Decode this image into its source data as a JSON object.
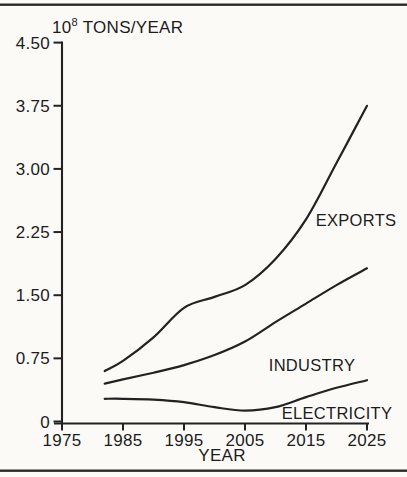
{
  "page": {
    "background": "#fbfaf7",
    "rule_color": "#2b2b29",
    "ink_color": "#222222",
    "text_color": "#1c1c1c"
  },
  "chart_data": {
    "type": "line",
    "title_base": "10",
    "title_exponent": "8",
    "title_rest": " TONS/YEAR",
    "xlabel": "YEAR",
    "ylabel": "",
    "xlim": [
      1975,
      2025
    ],
    "ylim": [
      0,
      4.5
    ],
    "grid": false,
    "x_ticks": [
      {
        "value": 1975,
        "label": "1975"
      },
      {
        "value": 1985,
        "label": "1985"
      },
      {
        "value": 1995,
        "label": "1995"
      },
      {
        "value": 2005,
        "label": "2005"
      },
      {
        "value": 2015,
        "label": "2015"
      },
      {
        "value": 2025,
        "label": "2025"
      }
    ],
    "y_ticks": [
      {
        "value": 0,
        "label": "0"
      },
      {
        "value": 0.75,
        "label": "0.75"
      },
      {
        "value": 1.5,
        "label": "1.50"
      },
      {
        "value": 2.25,
        "label": "2.25"
      },
      {
        "value": 3.0,
        "label": "3.00"
      },
      {
        "value": 3.75,
        "label": "3.75"
      },
      {
        "value": 4.5,
        "label": "4.50"
      }
    ],
    "series": [
      {
        "name": "EXPORTS",
        "points": [
          [
            1982,
            0.6
          ],
          [
            1985,
            0.72
          ],
          [
            1990,
            1.0
          ],
          [
            1995,
            1.35
          ],
          [
            2000,
            1.48
          ],
          [
            2005,
            1.62
          ],
          [
            2010,
            1.93
          ],
          [
            2015,
            2.4
          ],
          [
            2020,
            3.07
          ],
          [
            2025,
            3.75
          ]
        ]
      },
      {
        "name": "INDUSTRY",
        "points": [
          [
            1982,
            0.45
          ],
          [
            1985,
            0.5
          ],
          [
            1990,
            0.58
          ],
          [
            1995,
            0.67
          ],
          [
            2000,
            0.79
          ],
          [
            2005,
            0.95
          ],
          [
            2010,
            1.18
          ],
          [
            2015,
            1.4
          ],
          [
            2020,
            1.62
          ],
          [
            2025,
            1.82
          ]
        ]
      },
      {
        "name": "ELECTRICITY",
        "points": [
          [
            1982,
            0.27
          ],
          [
            1985,
            0.27
          ],
          [
            1990,
            0.26
          ],
          [
            1995,
            0.23
          ],
          [
            2000,
            0.17
          ],
          [
            2005,
            0.13
          ],
          [
            2010,
            0.17
          ],
          [
            2015,
            0.29
          ],
          [
            2020,
            0.4
          ],
          [
            2025,
            0.49
          ]
        ]
      }
    ]
  }
}
